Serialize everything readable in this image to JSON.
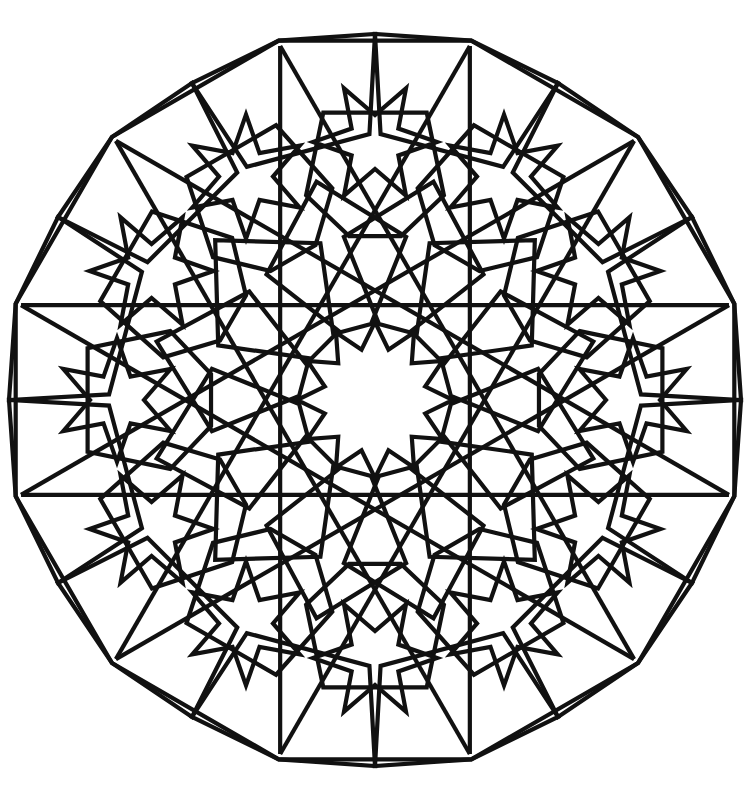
{
  "artwork": {
    "title": "Islamic Geometric Star Pattern",
    "kind": "line-drawing",
    "symmetry_order": 12,
    "background_color": "#ffffff",
    "stroke_color": "#111111",
    "stroke_width": 4.2,
    "canvas": {
      "width": 754,
      "height": 810
    }
  },
  "geometry": {
    "center": {
      "x": 375,
      "y": 400
    },
    "boundary": {
      "name": "outer-dodecagon",
      "sides": 12,
      "circumradius": 372,
      "rotation_deg": 15,
      "note": "flat top edge and flat bottom edge; left and right sides are vertical and clipped by canvas"
    },
    "central_star": {
      "name": "central-12-point-star",
      "points": 12,
      "outer_radius": 78,
      "inner_radius": 52,
      "rotation_deg": 0
    },
    "inner_ring": {
      "name": "inner-pentagon-ring",
      "count": 12,
      "orbit_radius": 148,
      "shape": "elongated-pentagon",
      "rotation_deg": 15
    },
    "mid_ring": {
      "name": "mid-hexagon-ring",
      "count": 12,
      "orbit_radius": 232,
      "shape": "irregular-hexagon",
      "rotation_deg": 0
    },
    "outer_star_ring": {
      "name": "outer-6-point-star-ring",
      "count": 12,
      "orbit_radius": 258,
      "points": 6,
      "outer_radius": 62,
      "inner_radius": 27
    },
    "rim_ring": {
      "name": "rim-pentagon-ring",
      "count": 12,
      "orbit_radius": 318,
      "shape": "pentagon"
    },
    "long_chords": {
      "name": "interlace-chord-set",
      "count": 12,
      "description": "straight bands crossing the field creating the interlace weave"
    }
  },
  "labels": {
    "figure_caption": ""
  }
}
